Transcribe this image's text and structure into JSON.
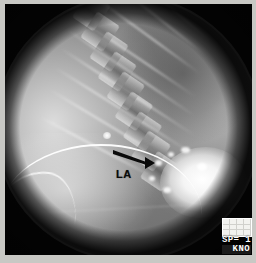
{
  "image": {
    "modality_description": "Lateral fluoroscopic contrast radiograph of the thorax and upper abdomen",
    "field_shape": "circular",
    "background_color": "#2a2a2a",
    "border_color": "#c8c8c4"
  },
  "annotations": [
    {
      "name": "arrow",
      "type": "arrow",
      "label": "",
      "color": "#0a0a0a",
      "direction": "right-down",
      "x": 112,
      "y": 148
    },
    {
      "name": "la-label",
      "type": "text",
      "label": "LA",
      "color": "#0a0a0a",
      "x": 116,
      "y": 169
    }
  ],
  "overlay": {
    "calibration_box": {
      "name": "grayscale-calibration-swatch",
      "color": "#f2f2ef",
      "columns": 4,
      "rows": 3
    },
    "lines": [
      {
        "text": "SP= 1",
        "boxed": false
      },
      {
        "text": "KNO",
        "boxed": true
      }
    ]
  },
  "anatomy": {
    "spine": {
      "label": "thoracic vertebral column",
      "vertebra_count": 9,
      "rotation_deg": 34
    },
    "ribs": {
      "label": "rib shadows",
      "count": 9
    },
    "contrast_pool": {
      "label": "contrast-filled gastric fundus",
      "color": "#ffffff"
    },
    "catheter": {
      "label": "nasogastric tube",
      "color": "#ffffff"
    },
    "lung_field": {
      "label": "lucent lung field"
    },
    "abdomen": {
      "label": "abdominal soft tissue"
    }
  }
}
